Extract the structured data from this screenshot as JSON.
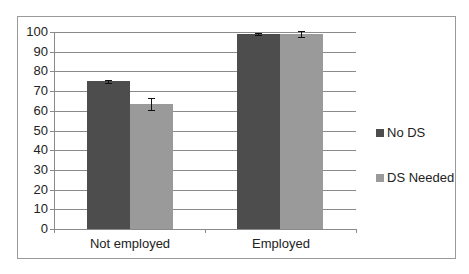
{
  "chart_data": {
    "type": "bar",
    "title": "",
    "xlabel": "",
    "ylabel": "",
    "categories": [
      "Not employed",
      "Employed"
    ],
    "series": [
      {
        "name": "No DS",
        "color": "#4d4d4d",
        "values": [
          75,
          99
        ],
        "error": [
          0.7,
          0.3
        ]
      },
      {
        "name": "DS Needed",
        "color": "#9a9a9a",
        "values": [
          63.5,
          99
        ],
        "error": [
          3,
          1.5
        ]
      }
    ],
    "ylim": [
      0,
      100
    ],
    "yticks": [
      0,
      10,
      20,
      30,
      40,
      50,
      60,
      70,
      80,
      90,
      100
    ],
    "grid": true,
    "legend_position": "right"
  },
  "legend": {
    "items": [
      {
        "label": "No DS",
        "color": "#4d4d4d"
      },
      {
        "label": "DS Needed",
        "color": "#9a9a9a"
      }
    ]
  },
  "axis": {
    "ytick_labels": [
      "0",
      "10",
      "20",
      "30",
      "40",
      "50",
      "60",
      "70",
      "80",
      "90",
      "100"
    ],
    "xtick_labels": [
      "Not employed",
      "Employed"
    ]
  }
}
